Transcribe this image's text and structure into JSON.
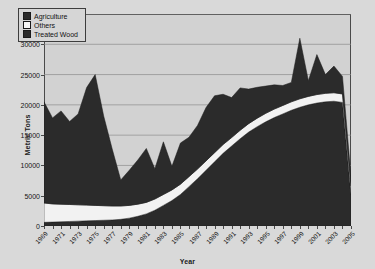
{
  "chart_data": {
    "type": "area",
    "stacked": true,
    "title": "",
    "xlabel": "Year",
    "ylabel": "Metric Tons",
    "ylim": [
      0,
      35000
    ],
    "ytick_values": [
      0,
      5000,
      10000,
      15000,
      20000,
      25000,
      30000,
      35000
    ],
    "ytick_labels": [
      "0",
      "5000",
      "10000",
      "15000",
      "20000",
      "25000",
      "30000",
      "35000"
    ],
    "grid": "horizontal",
    "legend_position": "top-left",
    "x": [
      1969,
      1970,
      1971,
      1972,
      1973,
      1974,
      1975,
      1976,
      1977,
      1978,
      1979,
      1980,
      1981,
      1982,
      1983,
      1984,
      1985,
      1986,
      1987,
      1988,
      1989,
      1990,
      1991,
      1992,
      1993,
      1994,
      1995,
      1996,
      1997,
      1998,
      1999,
      2000,
      2001,
      2002,
      2003,
      2004,
      2005
    ],
    "xtick_labels": [
      "1969",
      "1971",
      "1973",
      "1975",
      "1977",
      "1979",
      "1981",
      "1983",
      "1985",
      "1987",
      "1989",
      "1991",
      "1993",
      "1995",
      "1997",
      "1999",
      "2001",
      "2003",
      "2005"
    ],
    "xtick_step": 2,
    "series": [
      {
        "name": "Treated Wood",
        "color": "#2b2b2b",
        "stack_order": 1,
        "values": [
          600,
          650,
          700,
          750,
          800,
          850,
          900,
          950,
          1000,
          1100,
          1300,
          1600,
          2000,
          2600,
          3400,
          4200,
          5200,
          6500,
          7800,
          9200,
          10600,
          12000,
          13200,
          14400,
          15500,
          16400,
          17200,
          17900,
          18500,
          19100,
          19600,
          20000,
          20300,
          20500,
          20600,
          20400,
          5200
        ]
      },
      {
        "name": "Others",
        "color": "#f2f2f2",
        "stack_order": 2,
        "values": [
          3200,
          3000,
          2900,
          2800,
          2700,
          2600,
          2500,
          2400,
          2300,
          2200,
          2100,
          2000,
          1900,
          1850,
          1800,
          1750,
          1700,
          1650,
          1600,
          1550,
          1500,
          1450,
          1400,
          1400,
          1400,
          1400,
          1400,
          1400,
          1400,
          1400,
          1400,
          1400,
          1400,
          1400,
          1400,
          1400,
          1400
        ]
      },
      {
        "name": "Agriculture",
        "color": "#2b2b2b",
        "stack_order": 3,
        "values": [
          16700,
          14200,
          15400,
          13700,
          15000,
          19400,
          21600,
          14800,
          9400,
          4300,
          5800,
          7300,
          8900,
          5000,
          8700,
          3900,
          6800,
          6500,
          7200,
          8800,
          9400,
          8300,
          6600,
          7000,
          5700,
          5100,
          4500,
          4000,
          3300,
          3200,
          10000,
          2600,
          6600,
          3100,
          4400,
          2900,
          1500
        ]
      }
    ],
    "totals": [
      20500,
      17850,
      19000,
      17250,
      18500,
      22850,
      25000,
      18150,
      12700,
      7600,
      9200,
      10900,
      12800,
      9450,
      13900,
      9850,
      13700,
      14650,
      16600,
      19550,
      21500,
      21750,
      21200,
      22800,
      22600,
      22900,
      23100,
      23300,
      23200,
      23700,
      31000,
      24000,
      28300,
      25000,
      26400,
      24700,
      8100
    ]
  },
  "legend": {
    "items": [
      {
        "label": "Agriculture",
        "marker": "filled-square",
        "color": "#2b2b2b"
      },
      {
        "label": "Others",
        "marker": "hollow-square",
        "color": "#f7f7f7"
      },
      {
        "label": "Treated Wood",
        "marker": "filled-square",
        "color": "#2b2b2b"
      }
    ]
  }
}
